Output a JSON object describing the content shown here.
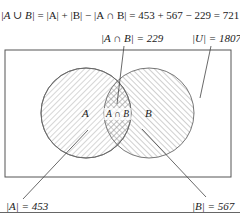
{
  "diagram": {
    "type": "venn",
    "formula": {
      "lhs": "|A ∪ B|",
      "rhs": "= |A| + |B| − |A ∩ B| = 453 + 567 − 229 = 721"
    },
    "labels": {
      "intersection_count": "|A ∩ B| = 229",
      "universe_count": "|U| = 1807",
      "a_count": "|A| = 453",
      "b_count": "|B| = 567",
      "set_a": "A",
      "set_b": "B",
      "intersection": "A ∩ B"
    },
    "values": {
      "A": 453,
      "B": 567,
      "A_and_B": 229,
      "A_or_B": 721,
      "U": 1807
    },
    "colors": {
      "stroke": "#555555",
      "hatch": "#8a8a8a",
      "text": "#222222"
    }
  }
}
